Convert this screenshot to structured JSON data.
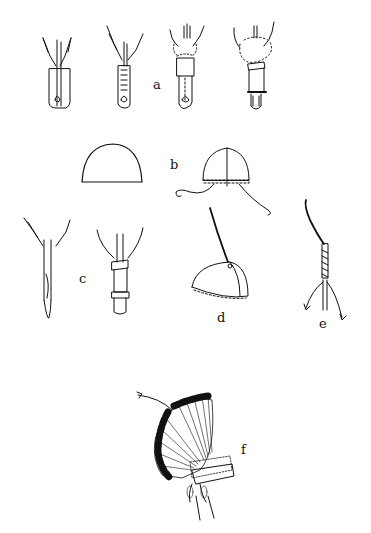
{
  "figure": {
    "background": "#ffffff",
    "ink": "#111111",
    "labels": [
      {
        "id": "a",
        "text": "a",
        "x": 153,
        "y": 78
      },
      {
        "id": "b",
        "text": "b",
        "x": 170,
        "y": 158
      },
      {
        "id": "c",
        "text": "c",
        "x": 79,
        "y": 272
      },
      {
        "id": "d",
        "text": "d",
        "x": 217,
        "y": 311
      },
      {
        "id": "e",
        "text": "e",
        "x": 319,
        "y": 317
      },
      {
        "id": "f",
        "text": "f",
        "x": 241,
        "y": 443
      }
    ],
    "panels": [
      {
        "id": "a",
        "description": "Four stages of attaching feather to quill socket with fluff and wrapping"
      },
      {
        "id": "b",
        "description": "Skullcap pattern and assembled cap with stitched brim and ties"
      },
      {
        "id": "c",
        "description": "Split quill end and wrapped quill base"
      },
      {
        "id": "d",
        "description": "Cap with thong attached at crown"
      },
      {
        "id": "e",
        "description": "Wrapped thong with trailing feathers"
      },
      {
        "id": "f",
        "description": "Completed war bonnet headdress"
      }
    ]
  }
}
